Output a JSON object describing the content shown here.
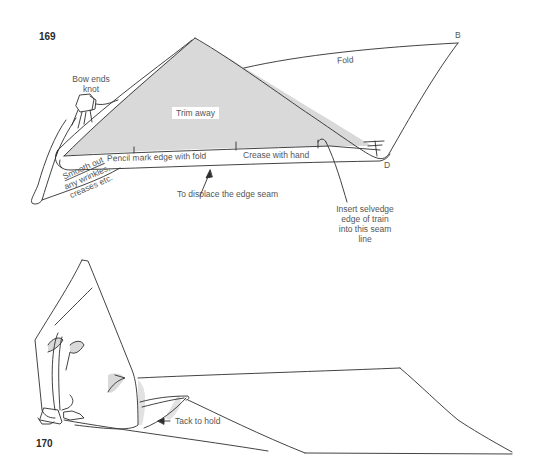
{
  "figures": [
    {
      "number": "169",
      "labels": {
        "point_b": "B",
        "point_d": "D",
        "fold": "Fold",
        "bow_ends_knot_line1": "Bow ends",
        "bow_ends_knot_line2": "knot",
        "trim_away": "Trim away",
        "pencil_mark": "Pencil mark edge with fold",
        "crease_with_hand": "Crease with hand",
        "displace_seam": "To displace the edge seam",
        "smooth_out_line1": "Smooth out",
        "smooth_out_line2": "any wrinkles,",
        "smooth_out_line3": "creases etc.",
        "insert_selvedge_line1": "Insert selvedge",
        "insert_selvedge_line2": "edge of train",
        "insert_selvedge_line3": "into this seam",
        "insert_selvedge_line4": "line"
      }
    },
    {
      "number": "170",
      "labels": {
        "tack_to_hold": "Tack to hold"
      }
    }
  ],
  "colors": {
    "shaded_fill": "#d9d9d9",
    "line": "#2e2e2e",
    "text": "#555555"
  }
}
